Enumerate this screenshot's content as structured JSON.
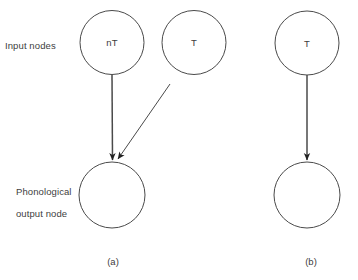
{
  "figure": {
    "background_color": "#ffffff",
    "stroke_color": "#4a4a4a",
    "text_color": "#404040",
    "row_labels": {
      "input": "Input nodes",
      "output_line1": "Phonological",
      "output_line2": "output node"
    },
    "panels": [
      {
        "id": "a",
        "caption": "(a)",
        "input_nodes": [
          {
            "label": "nT",
            "cx": 112,
            "cy": 42.5,
            "r": 32
          },
          {
            "label": "T",
            "cx": 194,
            "cy": 42.5,
            "r": 32
          }
        ],
        "output_nodes": [
          {
            "label": "",
            "cx": 112,
            "cy": 195,
            "r": 33
          }
        ],
        "edges": [
          {
            "from": "nT",
            "to": "output",
            "x1": 112,
            "y1": 75,
            "x2": 112.5,
            "y2": 160
          },
          {
            "from": "T",
            "to": "output",
            "x1": 170,
            "y1": 84,
            "x2": 118,
            "y2": 159
          }
        ]
      },
      {
        "id": "b",
        "caption": "(b)",
        "input_nodes": [
          {
            "label": "T",
            "cx": 307,
            "cy": 43,
            "r": 32
          }
        ],
        "output_nodes": [
          {
            "label": "",
            "cx": 307,
            "cy": 195,
            "r": 33
          }
        ],
        "edges": [
          {
            "from": "T",
            "to": "output",
            "x1": 307,
            "y1": 75,
            "x2": 307,
            "y2": 160
          }
        ]
      }
    ]
  }
}
